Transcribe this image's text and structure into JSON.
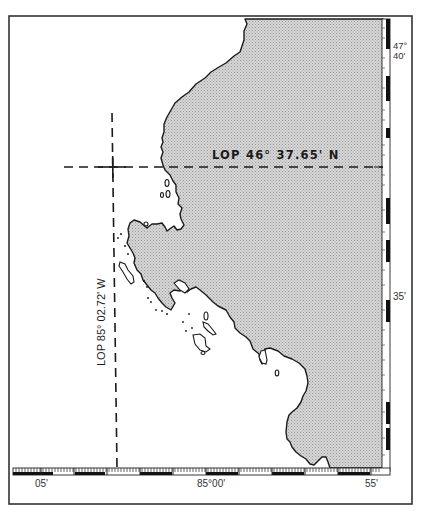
{
  "map": {
    "type": "nautical-chart-plot",
    "lop_latitude_label": "LOP  46° 37.65' N",
    "lop_longitude_label": "LOP 85° 02.72' W",
    "lat_labels": [
      {
        "text_deg": "47°",
        "text_min": "40'",
        "y": 47
      },
      {
        "text": "35'",
        "y": 296
      }
    ],
    "lon_labels": [
      {
        "text": "05'",
        "x": 33
      },
      {
        "text": "85°00'",
        "x": 198
      },
      {
        "text": "55'",
        "x": 367
      }
    ],
    "colors": {
      "land_fill": "#c9c9c9",
      "water": "#ffffff",
      "coast_line": "#1a1a1a",
      "frame": "#333333"
    }
  }
}
